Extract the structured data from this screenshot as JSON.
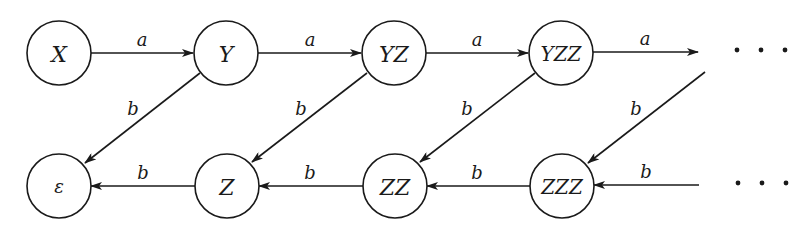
{
  "diagram": {
    "type": "state-transition-graph",
    "nodes": [
      {
        "id": "X",
        "label": "X",
        "cx": 59,
        "cy": 53
      },
      {
        "id": "Y",
        "label": "Y",
        "cx": 226,
        "cy": 53
      },
      {
        "id": "YZ",
        "label": "YZ",
        "cx": 394,
        "cy": 53
      },
      {
        "id": "YZZ",
        "label": "YZZ",
        "cx": 561,
        "cy": 53
      },
      {
        "id": "eps",
        "label": "ε",
        "cx": 59,
        "cy": 186
      },
      {
        "id": "Z",
        "label": "Z",
        "cx": 227,
        "cy": 186
      },
      {
        "id": "ZZ",
        "label": "ZZ",
        "cx": 395,
        "cy": 186
      },
      {
        "id": "ZZZ",
        "label": "ZZZ",
        "cx": 562,
        "cy": 186
      }
    ],
    "node_radius": 32,
    "edges": [
      {
        "from": "X",
        "to": "Y",
        "label": "a"
      },
      {
        "from": "Y",
        "to": "YZ",
        "label": "a"
      },
      {
        "from": "YZ",
        "to": "YZZ",
        "label": "a"
      },
      {
        "from": "YZZ",
        "to": "…",
        "label": "a"
      },
      {
        "from": "Y",
        "to": "eps",
        "label": "b"
      },
      {
        "from": "YZ",
        "to": "Z",
        "label": "b"
      },
      {
        "from": "YZZ",
        "to": "ZZ",
        "label": "b"
      },
      {
        "from": "…",
        "to": "ZZZ",
        "label": "b"
      },
      {
        "from": "Z",
        "to": "eps",
        "label": "b"
      },
      {
        "from": "ZZ",
        "to": "Z",
        "label": "b"
      },
      {
        "from": "ZZZ",
        "to": "ZZ",
        "label": "b"
      },
      {
        "from": "…",
        "to": "ZZZ",
        "label": "b"
      }
    ],
    "continuation": "…"
  },
  "labels": {
    "node_X": "X",
    "node_Y": "Y",
    "node_YZ": "YZ",
    "node_YZZ": "YZZ",
    "node_eps": "ε",
    "node_Z": "Z",
    "node_ZZ": "ZZ",
    "node_ZZZ": "ZZZ",
    "edge_a": "a",
    "edge_b": "b"
  }
}
